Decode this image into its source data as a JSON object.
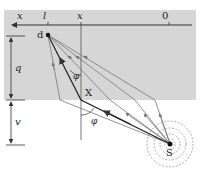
{
  "diagram": {
    "colors": {
      "region": "#d6d6d6",
      "line": "#333333",
      "ray": "#777777",
      "wave": "#888888"
    },
    "axis": {
      "labels": [
        "x",
        "l",
        "x",
        "0"
      ]
    },
    "points": {
      "detector": "d",
      "source": "S",
      "reflection": "X"
    },
    "dimensions": {
      "upper": "q",
      "lower": "v"
    },
    "angles": {
      "upper": "φ",
      "lower": "φ"
    }
  }
}
